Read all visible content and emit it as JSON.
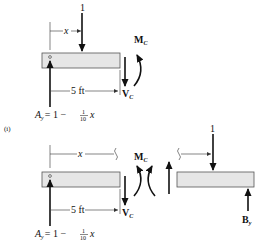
{
  "figure": {
    "part_label": "(i)",
    "top_fbd": {
      "load_label": "1",
      "distance_label": "x",
      "span_label": "5 ft",
      "moment_label": "M",
      "moment_sub": "C",
      "shear_label": "V",
      "shear_sub": "C",
      "reaction_lhs": "A",
      "reaction_sub": "y",
      "reaction_rhs": "= 1 −",
      "frac_num": "1",
      "frac_den": "10",
      "reaction_var": "x"
    },
    "bottom_left_fbd": {
      "distance_label": "x",
      "span_label": "5 ft",
      "moment_label": "M",
      "moment_sub": "C",
      "shear_label": "V",
      "shear_sub": "C",
      "reaction_lhs": "A",
      "reaction_sub": "y",
      "reaction_rhs": "= 1 −",
      "frac_num": "1",
      "frac_den": "10",
      "reaction_var": "x"
    },
    "bottom_right_fbd": {
      "load_label": "1",
      "reaction_label": "B",
      "reaction_sub": "y"
    }
  }
}
